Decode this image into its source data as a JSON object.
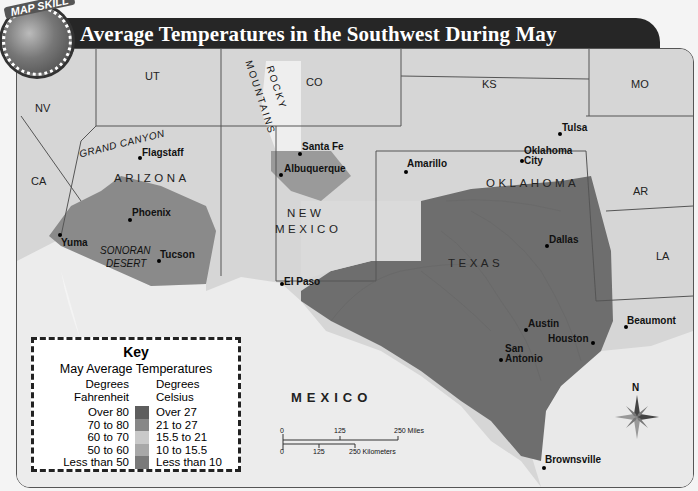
{
  "badge": {
    "label": "MAP SKILL"
  },
  "title": "Average Temperatures in the Southwest During May",
  "states": {
    "nv": "NV",
    "ut": "UT",
    "co": "CO",
    "ks": "KS",
    "mo": "MO",
    "ca": "CA",
    "ar": "AR",
    "la": "LA",
    "arizona": "ARIZONA",
    "new": "NEW",
    "mexico_state": "MEXICO",
    "oklahoma": "OKLAHOMA",
    "texas": "TEXAS",
    "mexico_country": "MEXICO"
  },
  "features": {
    "grand_canyon": "GRAND CANYON",
    "rocky": "ROCKY",
    "mountains": "MOUNTAINS",
    "sonoran": "SONORAN",
    "desert": "DESERT"
  },
  "cities": {
    "flagstaff": "Flagstaff",
    "phoenix": "Phoenix",
    "yuma": "Yuma",
    "tucson": "Tucson",
    "santa_fe": "Santa Fe",
    "albuquerque": "Albuquerque",
    "el_paso": "El Paso",
    "amarillo": "Amarillo",
    "tulsa": "Tulsa",
    "oklahoma_city_1": "Oklahoma",
    "oklahoma_city_2": "City",
    "dallas": "Dallas",
    "austin": "Austin",
    "houston": "Houston",
    "san_antonio_1": "San",
    "san_antonio_2": "Antonio",
    "beaumont": "Beaumont",
    "brownsville": "Brownsville"
  },
  "key": {
    "title": "Key",
    "subtitle": "May Average Temperatures",
    "fahrenheit_header_1": "Degrees",
    "fahrenheit_header_2": "Fahrenheit",
    "celsius_header_1": "Degrees",
    "celsius_header_2": "Celsius",
    "rows": [
      {
        "f": "Over 80",
        "c": "Over 27",
        "color": "#5e5e5e"
      },
      {
        "f": "70 to 80",
        "c": "21 to 27",
        "color": "#878787"
      },
      {
        "f": "60 to 70",
        "c": "15.5 to 21",
        "color": "#c9c9c9"
      },
      {
        "f": "50 to 60",
        "c": "10 to 15.5",
        "color": "#a8a8a8"
      },
      {
        "f": "Less than 50",
        "c": "Less than 10",
        "color": "#7a7a7a"
      }
    ]
  },
  "scale": {
    "miles": {
      "zero": "0",
      "mid": "125",
      "end": "250 Miles"
    },
    "km": {
      "zero": "0",
      "mid": "125",
      "end": "250 Kilometers"
    }
  },
  "compass": {
    "north": "N"
  }
}
